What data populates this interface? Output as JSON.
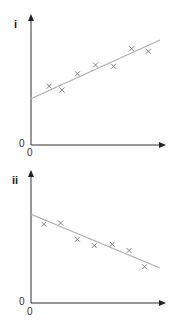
{
  "chart_data": [
    {
      "type": "scatter",
      "title": "i",
      "xlabel": "",
      "ylabel": "",
      "x_tick_labels": [
        "0"
      ],
      "y_tick_labels": [
        "0"
      ],
      "xlim": [
        0,
        10
      ],
      "ylim": [
        0,
        10
      ],
      "grid": false,
      "legend": null,
      "series": [
        {
          "name": "data points",
          "marker": "x",
          "x": [
            1.4,
            2.4,
            3.6,
            5.0,
            6.4,
            7.8,
            9.1
          ],
          "y": [
            4.7,
            4.4,
            5.7,
            6.4,
            6.3,
            7.7,
            7.5
          ]
        },
        {
          "name": "line of best fit",
          "style": "line",
          "x": [
            0,
            10
          ],
          "y": [
            3.7,
            8.4
          ]
        }
      ],
      "annotations": [
        "positive correlation, non-zero y-intercept"
      ]
    },
    {
      "type": "scatter",
      "title": "ii",
      "xlabel": "",
      "ylabel": "",
      "x_tick_labels": [
        "0"
      ],
      "y_tick_labels": [
        "0"
      ],
      "xlim": [
        0,
        10
      ],
      "ylim": [
        0,
        10
      ],
      "grid": false,
      "legend": null,
      "series": [
        {
          "name": "data points",
          "marker": "x",
          "x": [
            1.0,
            2.3,
            3.6,
            4.9,
            6.3,
            7.6,
            8.8
          ],
          "y": [
            6.3,
            6.4,
            5.1,
            4.6,
            4.7,
            4.2,
            2.9
          ]
        },
        {
          "name": "line of best fit",
          "style": "line",
          "x": [
            0,
            10
          ],
          "y": [
            7.1,
            2.8
          ]
        }
      ],
      "annotations": [
        "negative correlation, non-zero y-intercept"
      ]
    }
  ],
  "panels": [
    {
      "label": "i",
      "origin_y": "0",
      "origin_x": "0"
    },
    {
      "label": "ii",
      "origin_y": "0",
      "origin_x": "0"
    }
  ],
  "colors": {
    "axis": "#333333",
    "line": "#b0b0b0",
    "marker": "#777777"
  }
}
